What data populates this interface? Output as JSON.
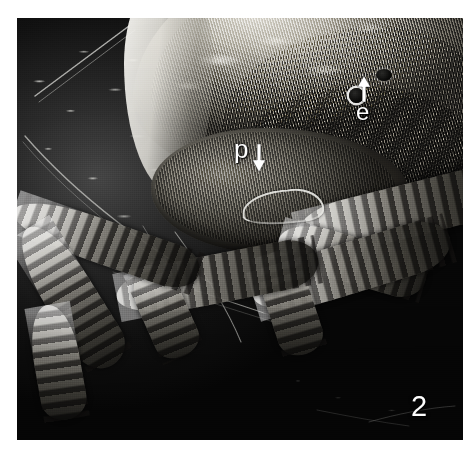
{
  "figure": {
    "number": "2",
    "medium": "scanning electron micrograph",
    "background_color": "#080808",
    "plate_bounds": {
      "x": 17,
      "y": 18,
      "width": 446,
      "height": 422
    }
  },
  "annotations": [
    {
      "id": "eye",
      "label": "e",
      "arrow": "up-arrow-icon",
      "color": "#ffffff",
      "points_to": "eye-spot",
      "position": {
        "x": 356,
        "y": 100
      }
    },
    {
      "id": "palp",
      "label": "p",
      "arrow": "down-arrow-icon",
      "color": "#ffffff",
      "points_to": "palp-structure",
      "position": {
        "x": 234,
        "y": 136
      }
    }
  ],
  "figure_number": {
    "text": "2",
    "color": "#fdfdfd",
    "position": {
      "x": 411,
      "y": 392
    }
  },
  "structures": {
    "idiosoma": "striated dorsal body shield",
    "gnathosoma": "ventral mouthpart shield",
    "eye_spot": "dark circular ocellus",
    "palp": "curved bright pedipalp",
    "legs": "segmented banded appendages",
    "substrate": "dark debris-covered surface"
  }
}
